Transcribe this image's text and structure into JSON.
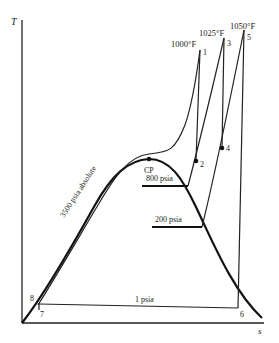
{
  "diagram": {
    "type": "T-s diagram (Rankine cycle with reheat)",
    "axes": {
      "y_label": "T",
      "x_label": "s"
    },
    "temperatures": {
      "t1": "1000°F",
      "t3": "1025°F",
      "t5": "1050°F"
    },
    "pressures": {
      "high": "3500 psia absolute",
      "p800": "800 psia",
      "p200": "200 psia",
      "low": "1 psia"
    },
    "critical_point": "CP",
    "state_points": [
      "1",
      "2",
      "3",
      "4",
      "5",
      "6",
      "7",
      "8"
    ],
    "colors": {
      "line": "#1a1a1a",
      "background": "#ffffff"
    }
  }
}
